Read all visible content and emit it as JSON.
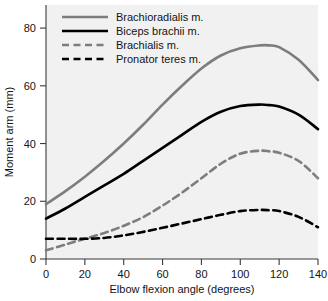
{
  "chart_data": {
    "type": "line",
    "title": "",
    "xlabel": "Elbow flexion angle (degrees)",
    "ylabel": "Moment arm (mm)",
    "xlim": [
      0,
      140
    ],
    "ylim": [
      0,
      88
    ],
    "xticks": [
      0,
      20,
      40,
      60,
      80,
      100,
      120,
      140
    ],
    "yticks": [
      0,
      20,
      40,
      60,
      80
    ],
    "xtick_labels": [
      "0",
      "20",
      "40",
      "60",
      "80",
      "100",
      "120",
      "140"
    ],
    "ytick_labels": [
      "0",
      "20",
      "40",
      "60",
      "80"
    ],
    "grid": false,
    "legend_position": "top-left",
    "x": [
      0,
      10,
      20,
      30,
      40,
      50,
      60,
      70,
      80,
      90,
      100,
      110,
      115,
      120,
      130,
      140
    ],
    "series": [
      {
        "name": "Brachioradialis m.",
        "color": "#7d7d7d",
        "style": "solid",
        "width": 2.6,
        "values": [
          19.0,
          23.5,
          28.5,
          34.0,
          40.0,
          46.5,
          53.5,
          60.0,
          66.0,
          70.5,
          73.0,
          74.0,
          74.0,
          73.4,
          69.0,
          62.0
        ],
        "peak_x": 115,
        "peak_y": 74.0
      },
      {
        "name": "Biceps brachii m.",
        "color": "#000000",
        "style": "solid",
        "width": 2.6,
        "values": [
          14.0,
          17.5,
          21.5,
          25.5,
          29.5,
          34.0,
          38.5,
          43.0,
          47.5,
          51.0,
          53.0,
          53.5,
          53.3,
          52.8,
          50.0,
          45.0
        ],
        "peak_x": 108,
        "peak_y": 53.5
      },
      {
        "name": "Brachialis m.",
        "color": "#7d7d7d",
        "style": "dashed",
        "width": 2.6,
        "values": [
          3.0,
          5.0,
          7.0,
          9.0,
          11.5,
          14.5,
          18.5,
          23.0,
          28.0,
          33.0,
          36.5,
          37.5,
          37.3,
          36.8,
          34.0,
          28.0
        ],
        "peak_x": 107,
        "peak_y": 37.5
      },
      {
        "name": "Pronator teres m.",
        "color": "#000000",
        "style": "dashed",
        "width": 2.6,
        "values": [
          7.0,
          7.0,
          7.0,
          7.3,
          8.2,
          9.4,
          10.8,
          12.3,
          13.8,
          15.3,
          16.6,
          17.0,
          16.9,
          16.6,
          14.6,
          11.0
        ],
        "peak_x": 106,
        "peak_y": 17.0
      }
    ]
  },
  "legend": {
    "items": [
      {
        "label": "Brachioradialis m."
      },
      {
        "label": "Biceps brachii m."
      },
      {
        "label": "Brachialis m."
      },
      {
        "label": "Pronator teres m."
      }
    ]
  }
}
